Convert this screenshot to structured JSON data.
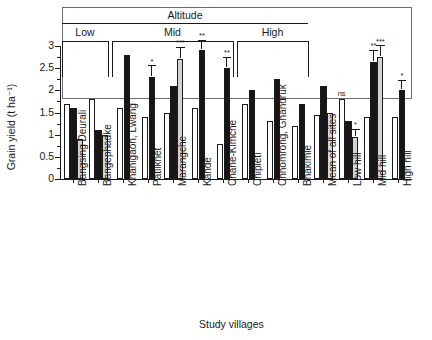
{
  "chart_data": {
    "type": "bar",
    "title": "",
    "xlabel": "Study villages",
    "ylabel": "Grain yield (t ha⁻¹)",
    "ylim": [
      0,
      3
    ],
    "yticks": [
      "0",
      "0.5",
      "1",
      "1.5",
      "2",
      "2.5",
      "3"
    ],
    "ytick_values": [
      0,
      0.5,
      1,
      1.5,
      2,
      2.5,
      3
    ],
    "grid": false,
    "legend_position": "none",
    "series_names": [
      "white",
      "black",
      "grey"
    ],
    "categories": [
      "Bangsing Deurali",
      "Bangephadke",
      "Khanigaon, Lwang",
      "Patlikhet",
      "Marangche",
      "Kande",
      "Chane-Kimche",
      "Chipleti",
      "Chhomrong, Ghandruk",
      "Bhakimle",
      "Mean of all sites",
      "Low hill",
      "Mid hill",
      "High hill"
    ],
    "groups": [
      {
        "category": "Bangsing Deurali",
        "altitude": "Low",
        "bars": [
          {
            "series": "white",
            "value": 1.7
          },
          {
            "series": "black",
            "value": 1.6
          },
          {
            "series": "grey",
            "value": 0.9
          }
        ]
      },
      {
        "category": "Bangephadke",
        "altitude": "Low",
        "bars": [
          {
            "series": "white",
            "value": 1.8
          },
          {
            "series": "black",
            "value": 1.1
          },
          {
            "series": "grey",
            "value": 1.0
          }
        ]
      },
      {
        "category": "Khanigaon, Lwang",
        "altitude": "Mid",
        "bars": [
          {
            "series": "white",
            "value": 1.6
          },
          {
            "series": "black",
            "value": 2.8
          }
        ]
      },
      {
        "category": "Patlikhet",
        "altitude": "Mid",
        "bars": [
          {
            "series": "white",
            "value": 1.4
          },
          {
            "series": "black",
            "value": 2.3,
            "error": 0.12,
            "significance": "*"
          }
        ]
      },
      {
        "category": "Marangche",
        "altitude": "Mid",
        "bars": [
          {
            "series": "white",
            "value": 1.5
          },
          {
            "series": "black",
            "value": 2.1
          },
          {
            "series": "grey",
            "value": 2.7,
            "error": 0.13,
            "significance": "***"
          }
        ]
      },
      {
        "category": "Kande",
        "altitude": "Mid",
        "bars": [
          {
            "series": "white",
            "value": 1.6
          },
          {
            "series": "black",
            "value": 2.9,
            "error": 0.11,
            "significance": "**"
          }
        ]
      },
      {
        "category": "Chane-Kimche",
        "altitude": "Mid",
        "bars": [
          {
            "series": "white",
            "value": 0.8
          },
          {
            "series": "black",
            "value": 2.5,
            "error": 0.12,
            "significance": "**"
          }
        ]
      },
      {
        "category": "Chipleti",
        "altitude": "High",
        "bars": [
          {
            "series": "white",
            "value": 1.7
          },
          {
            "series": "black",
            "value": 2.0
          }
        ]
      },
      {
        "category": "Chhomrong, Ghandruk",
        "altitude": "High",
        "bars": [
          {
            "series": "white",
            "value": 1.3
          },
          {
            "series": "black",
            "value": 2.25
          }
        ]
      },
      {
        "category": "Bhakimle",
        "altitude": "High",
        "bars": [
          {
            "series": "white",
            "value": 1.2
          },
          {
            "series": "black",
            "value": 1.7
          }
        ]
      },
      {
        "category": "Mean of all sites",
        "altitude": "",
        "bars": [
          {
            "series": "white",
            "value": 1.45
          },
          {
            "series": "black",
            "value": 2.1
          },
          {
            "series": "grey",
            "value": 1.5
          }
        ]
      },
      {
        "category": "Low hill",
        "altitude": "",
        "bars": [
          {
            "series": "white",
            "value": 1.8,
            "significance": "ns"
          },
          {
            "series": "black",
            "value": 1.3
          },
          {
            "series": "grey",
            "value": 0.95,
            "error": 0.08,
            "significance": "*"
          }
        ]
      },
      {
        "category": "Mid hill",
        "altitude": "",
        "bars": [
          {
            "series": "white",
            "value": 1.4
          },
          {
            "series": "black",
            "value": 2.65,
            "error": 0.12,
            "significance": "**"
          },
          {
            "series": "grey",
            "value": 2.75,
            "error": 0.12,
            "significance": "***"
          }
        ]
      },
      {
        "category": "High hill",
        "altitude": "",
        "bars": [
          {
            "series": "white",
            "value": 1.4
          },
          {
            "series": "black",
            "value": 2.0,
            "error": 0.11,
            "significance": "*"
          }
        ]
      }
    ],
    "annotations": {
      "altitude_label": "Altitude",
      "altitude_bands": [
        {
          "label": "Low",
          "first_group": 0,
          "last_group": 1
        },
        {
          "label": "Mid",
          "first_group": 2,
          "last_group": 6
        },
        {
          "label": "High",
          "first_group": 7,
          "last_group": 9
        }
      ]
    }
  },
  "colors": {
    "series_white": "#ffffff",
    "series_black": "#161616",
    "series_grey": "#d4d4d4",
    "axis": "#1a1a1a",
    "box_border": "#6d6d6d",
    "background": "#ffffff"
  }
}
